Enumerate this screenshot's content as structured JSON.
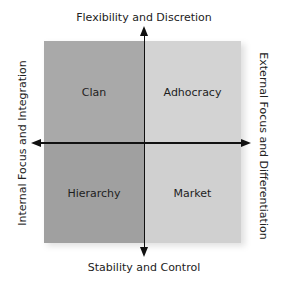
{
  "diagram": {
    "axes": {
      "top": "Flexibility and Discretion",
      "bottom": "Stability and Control",
      "left": "Internal Focus and Integration",
      "right": "External Focus and Differentiation"
    },
    "quadrants": {
      "top_left": {
        "label": "Clan",
        "color": "#a9a9a9"
      },
      "top_right": {
        "label": "Adhocracy",
        "color": "#d3d3d3"
      },
      "bottom_left": {
        "label": "Hierarchy",
        "color": "#a0a0a0"
      },
      "bottom_right": {
        "label": "Market",
        "color": "#d0d0d0"
      }
    },
    "axis_color": "#111111"
  }
}
